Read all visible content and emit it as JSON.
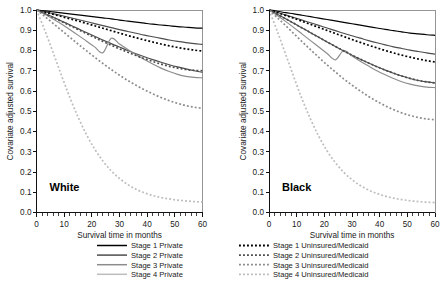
{
  "figure": {
    "x_axis_label": "Survival time in months",
    "y_axis_label": "Covariate adjusted survival",
    "x_ticks": [
      "0",
      "10",
      "20",
      "30",
      "40",
      "50",
      "60"
    ],
    "y_ticks": [
      "0.0",
      "0.1",
      "0.2",
      "0.3",
      "0.4",
      "0.5",
      "0.6",
      "0.7",
      "0.8",
      "0.9",
      "1.0"
    ],
    "panels": [
      {
        "label": "White"
      },
      {
        "label": "Black"
      }
    ],
    "legend": {
      "column_private": [
        "Stage 1 Private",
        "Stage 2 Private",
        "Stage 3 Private",
        "Stage 4 Private"
      ],
      "column_uninsured": [
        "Stage 1 Uninsured/Medicaid",
        "Stage 2 Uninsured/Medicaid",
        "Stage 3 Uninsured/Medicaid",
        "Stage 4 Uninsured/Medicaid"
      ]
    },
    "colors": {
      "stage1": "#000000",
      "stage2": "#4d4d4d",
      "stage3": "#8c8c8c",
      "stage4": "#bdbdbd",
      "frame": "#8a8a8a",
      "axis": "#111111",
      "background": "#ffffff"
    }
  },
  "chart_data": {
    "type": "line",
    "title": "",
    "xlabel": "Survival time in months",
    "ylabel": "Covariate adjusted survival",
    "xlim": [
      0,
      60
    ],
    "ylim": [
      0.0,
      1.0
    ],
    "xticks": [
      0,
      10,
      20,
      30,
      40,
      50,
      60
    ],
    "xminor_step": 2,
    "yticks": [
      0.0,
      0.1,
      0.2,
      0.3,
      0.4,
      0.5,
      0.6,
      0.7,
      0.8,
      0.9,
      1.0
    ],
    "grid": false,
    "legend_position": "below",
    "x": [
      0,
      3,
      6,
      9,
      12,
      15,
      18,
      21,
      24,
      27,
      30,
      33,
      36,
      39,
      42,
      45,
      48,
      51,
      54,
      57,
      60
    ],
    "panels": [
      {
        "name": "White",
        "series": [
          {
            "name": "Stage 1 Private",
            "style": "solid",
            "color": "#000000",
            "values": [
              1.0,
              0.996,
              0.991,
              0.986,
              0.981,
              0.976,
              0.971,
              0.966,
              0.961,
              0.956,
              0.95,
              0.945,
              0.94,
              0.935,
              0.93,
              0.926,
              0.922,
              0.918,
              0.915,
              0.912,
              0.91
            ]
          },
          {
            "name": "Stage 2 Private",
            "style": "solid",
            "color": "#4d4d4d",
            "values": [
              1.0,
              0.991,
              0.982,
              0.973,
              0.963,
              0.953,
              0.943,
              0.933,
              0.923,
              0.913,
              0.903,
              0.894,
              0.885,
              0.876,
              0.868,
              0.86,
              0.852,
              0.845,
              0.839,
              0.834,
              0.83
            ]
          },
          {
            "name": "Stage 3 Private",
            "style": "solid",
            "color": "#4d4d4d",
            "values": [
              1.0,
              0.983,
              0.965,
              0.946,
              0.927,
              0.908,
              0.889,
              0.87,
              0.852,
              0.834,
              0.817,
              0.8,
              0.784,
              0.769,
              0.755,
              0.742,
              0.73,
              0.719,
              0.709,
              0.7,
              0.692
            ]
          },
          {
            "name": "Stage 4 Private",
            "style": "solid",
            "color": "#8c8c8c",
            "values": [
              1.0,
              0.979,
              0.956,
              0.931,
              0.904,
              0.876,
              0.847,
              0.818,
              0.789,
              0.86,
              0.832,
              0.805,
              0.779,
              0.755,
              0.733,
              0.713,
              0.696,
              0.682,
              0.672,
              0.667,
              0.665
            ]
          },
          {
            "name": "Stage 1 Uninsured/Medicaid",
            "style": "dashed",
            "color": "#000000",
            "values": [
              1.0,
              0.99,
              0.979,
              0.968,
              0.957,
              0.946,
              0.934,
              0.922,
              0.91,
              0.898,
              0.886,
              0.874,
              0.863,
              0.852,
              0.842,
              0.832,
              0.823,
              0.815,
              0.808,
              0.802,
              0.797
            ]
          },
          {
            "name": "Stage 2 Uninsured/Medicaid",
            "style": "dashed",
            "color": "#4d4d4d",
            "values": [
              1.0,
              0.982,
              0.963,
              0.944,
              0.924,
              0.904,
              0.884,
              0.864,
              0.845,
              0.826,
              0.808,
              0.791,
              0.775,
              0.76,
              0.746,
              0.733,
              0.722,
              0.713,
              0.706,
              0.702,
              0.7
            ]
          },
          {
            "name": "Stage 3 Uninsured/Medicaid",
            "style": "dashed",
            "color": "#8c8c8c",
            "values": [
              1.0,
              0.968,
              0.934,
              0.9,
              0.866,
              0.832,
              0.799,
              0.767,
              0.736,
              0.706,
              0.678,
              0.652,
              0.628,
              0.606,
              0.586,
              0.568,
              0.552,
              0.539,
              0.528,
              0.52,
              0.515
            ]
          },
          {
            "name": "Stage 4 Uninsured/Medicaid",
            "style": "dashed",
            "color": "#bdbdbd",
            "values": [
              1.0,
              0.9,
              0.79,
              0.678,
              0.57,
              0.472,
              0.386,
              0.314,
              0.254,
              0.206,
              0.168,
              0.138,
              0.115,
              0.097,
              0.084,
              0.074,
              0.067,
              0.061,
              0.057,
              0.054,
              0.052
            ]
          }
        ]
      },
      {
        "name": "Black",
        "series": [
          {
            "name": "Stage 1 Private",
            "style": "solid",
            "color": "#000000",
            "values": [
              1.0,
              0.994,
              0.987,
              0.981,
              0.974,
              0.967,
              0.96,
              0.953,
              0.946,
              0.939,
              0.932,
              0.925,
              0.918,
              0.911,
              0.904,
              0.898,
              0.892,
              0.886,
              0.882,
              0.878,
              0.875
            ]
          },
          {
            "name": "Stage 2 Private",
            "style": "solid",
            "color": "#4d4d4d",
            "values": [
              1.0,
              0.988,
              0.976,
              0.963,
              0.95,
              0.937,
              0.924,
              0.911,
              0.898,
              0.885,
              0.873,
              0.861,
              0.849,
              0.838,
              0.828,
              0.818,
              0.81,
              0.802,
              0.795,
              0.788,
              0.782
            ]
          },
          {
            "name": "Stage 3 Private",
            "style": "solid",
            "color": "#4d4d4d",
            "values": [
              1.0,
              0.979,
              0.957,
              0.934,
              0.911,
              0.888,
              0.865,
              0.842,
              0.82,
              0.798,
              0.777,
              0.757,
              0.738,
              0.72,
              0.703,
              0.688,
              0.674,
              0.662,
              0.652,
              0.645,
              0.64
            ]
          },
          {
            "name": "Stage 4 Private",
            "style": "solid",
            "color": "#8c8c8c",
            "values": [
              1.0,
              0.973,
              0.944,
              0.913,
              0.881,
              0.849,
              0.817,
              0.785,
              0.754,
              0.8,
              0.773,
              0.747,
              0.723,
              0.7,
              0.68,
              0.662,
              0.646,
              0.634,
              0.625,
              0.619,
              0.617
            ]
          },
          {
            "name": "Stage 1 Uninsured/Medicaid",
            "style": "dashed",
            "color": "#000000",
            "values": [
              1.0,
              0.987,
              0.973,
              0.959,
              0.944,
              0.929,
              0.914,
              0.899,
              0.884,
              0.869,
              0.854,
              0.84,
              0.826,
              0.813,
              0.8,
              0.788,
              0.777,
              0.767,
              0.758,
              0.75,
              0.743
            ]
          },
          {
            "name": "Stage 2 Uninsured/Medicaid",
            "style": "dashed",
            "color": "#4d4d4d",
            "values": [
              1.0,
              0.979,
              0.957,
              0.934,
              0.911,
              0.888,
              0.865,
              0.842,
              0.82,
              0.798,
              0.777,
              0.757,
              0.738,
              0.72,
              0.703,
              0.688,
              0.674,
              0.662,
              0.652,
              0.645,
              0.64
            ]
          },
          {
            "name": "Stage 3 Uninsured/Medicaid",
            "style": "dashed",
            "color": "#8c8c8c",
            "values": [
              1.0,
              0.962,
              0.923,
              0.883,
              0.843,
              0.804,
              0.766,
              0.729,
              0.694,
              0.66,
              0.629,
              0.6,
              0.573,
              0.549,
              0.527,
              0.508,
              0.492,
              0.479,
              0.469,
              0.462,
              0.458
            ]
          },
          {
            "name": "Stage 4 Uninsured/Medicaid",
            "style": "dashed",
            "color": "#bdbdbd",
            "values": [
              1.0,
              0.895,
              0.782,
              0.668,
              0.559,
              0.461,
              0.376,
              0.304,
              0.246,
              0.199,
              0.162,
              0.133,
              0.111,
              0.094,
              0.081,
              0.071,
              0.064,
              0.058,
              0.054,
              0.051,
              0.049
            ]
          }
        ]
      }
    ]
  }
}
